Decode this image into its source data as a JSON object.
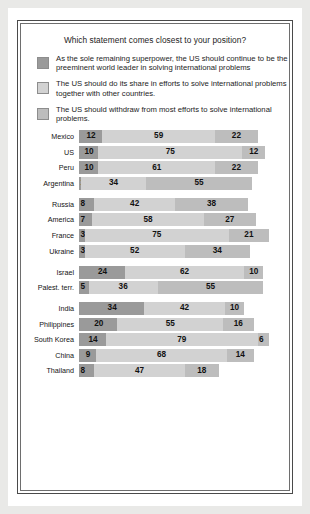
{
  "figure": {
    "title": "Which statement comes closest to your position?"
  },
  "legend": {
    "items": [
      {
        "label": "As the sole remaining superpower, the US should continue to be the preeminent world leader in solving international problems",
        "color": "#9a9a9a",
        "swatch_name": "legend-swatch-preeminent-leader"
      },
      {
        "label": "The US should do its share in efforts to solve international problems together with other countries.",
        "color": "#d2d2d2",
        "swatch_name": "legend-swatch-do-its-share"
      },
      {
        "label": "The US should withdraw from most efforts to solve international problems.",
        "color": "#bdbdbd",
        "swatch_name": "legend-swatch-withdraw"
      }
    ]
  },
  "chart_data": {
    "type": "bar",
    "orientation": "horizontal",
    "stacked": true,
    "title": "Which statement comes closest to your position?",
    "xlabel": "",
    "ylabel": "",
    "xlim": [
      0,
      100
    ],
    "grid": false,
    "legend_position": "top",
    "series": [
      {
        "name": "As the sole remaining superpower, the US should continue to be the preeminent world leader in solving international problems",
        "color": "#9a9a9a"
      },
      {
        "name": "The US should do its share in efforts to solve international problems together with other countries.",
        "color": "#d2d2d2"
      },
      {
        "name": "The US should withdraw from most efforts to solve international problems.",
        "color": "#bdbdbd"
      }
    ],
    "groups": [
      {
        "rows": [
          {
            "label": "Mexico",
            "values": [
              12,
              59,
              22
            ]
          },
          {
            "label": "US",
            "values": [
              10,
              75,
              12
            ]
          },
          {
            "label": "Peru",
            "values": [
              10,
              61,
              22
            ]
          },
          {
            "label": "Argentina",
            "values": [
              1,
              34,
              55
            ]
          }
        ]
      },
      {
        "rows": [
          {
            "label": "Russia",
            "values": [
              8,
              42,
              38
            ]
          },
          {
            "label": "America",
            "values": [
              7,
              58,
              27
            ]
          },
          {
            "label": "France",
            "values": [
              3,
              75,
              21
            ]
          },
          {
            "label": "Ukraine",
            "values": [
              3,
              52,
              34
            ]
          }
        ]
      },
      {
        "rows": [
          {
            "label": "Israel",
            "values": [
              24,
              62,
              10
            ]
          },
          {
            "label": "Palest. terr.",
            "values": [
              5,
              36,
              55
            ]
          }
        ]
      },
      {
        "rows": [
          {
            "label": "India",
            "values": [
              34,
              42,
              10
            ]
          },
          {
            "label": "Philippines",
            "values": [
              20,
              55,
              16
            ]
          },
          {
            "label": "South Korea",
            "values": [
              14,
              79,
              6
            ]
          },
          {
            "label": "China",
            "values": [
              9,
              68,
              14
            ]
          },
          {
            "label": "Thailand",
            "values": [
              8,
              47,
              18
            ]
          }
        ]
      }
    ]
  }
}
